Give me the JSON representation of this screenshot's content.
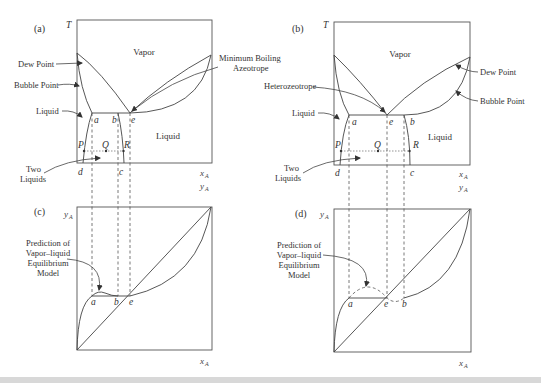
{
  "panels": {
    "a": {
      "label": "(a)",
      "y_axis": "T",
      "x_axis": "x",
      "x_axis_sub": "A",
      "y_axis2": "y",
      "y_axis2_sub": "A",
      "region_vapor": "Vapor",
      "region_liquid": "Liquid",
      "callout_dew_point": "Dew Point",
      "callout_bubble_point": "Bubble Point",
      "callout_liquid": "Liquid",
      "callout_azeotrope_line1": "Minimum Boiling",
      "callout_azeotrope_line2": "Azeotrope",
      "callout_two_liquids_line1": "Two",
      "callout_two_liquids_line2": "Liquids",
      "point_a": "a",
      "point_b": "b",
      "point_e": "e",
      "point_c": "c",
      "point_d": "d",
      "point_P": "P",
      "point_Q": "Q",
      "point_R": "R"
    },
    "b": {
      "label": "(b)",
      "y_axis": "T",
      "x_axis": "x",
      "x_axis_sub": "A",
      "y_axis2": "y",
      "y_axis2_sub": "A",
      "region_vapor": "Vapor",
      "region_liquid": "Liquid",
      "callout_dew_point": "Dew Point",
      "callout_bubble_point": "Bubble Point",
      "callout_liquid": "Liquid",
      "callout_heterozeotrope": "Heterozeotrope",
      "callout_two_liquids_line1": "Two",
      "callout_two_liquids_line2": "Liquids",
      "point_a": "a",
      "point_b": "b",
      "point_e": "e",
      "point_c": "c",
      "point_d": "d",
      "point_P": "P",
      "point_Q": "Q",
      "point_R": "R"
    },
    "c": {
      "label": "(c)",
      "y_axis": "y",
      "y_axis_sub": "A",
      "x_axis": "x",
      "x_axis_sub": "A",
      "callout_line1": "Prediction of",
      "callout_line2": "Vapor–liquid",
      "callout_line3": "Equilibrium",
      "callout_line4": "Model",
      "point_a": "a",
      "point_b": "b",
      "point_e": "e"
    },
    "d": {
      "label": "(d)",
      "y_axis": "y",
      "y_axis_sub": "A",
      "x_axis": "x",
      "x_axis_sub": "A",
      "callout_line1": "Prediction of",
      "callout_line2": "Vapor–liquid",
      "callout_line3": "Equilibrium",
      "callout_line4": "Model",
      "point_a": "a",
      "point_e": "e",
      "point_b": "b"
    }
  }
}
